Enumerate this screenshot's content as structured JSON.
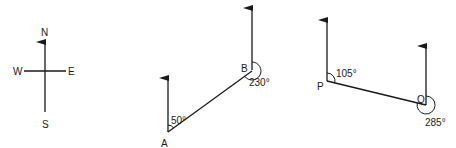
{
  "compass": {
    "north": "N",
    "south": "S",
    "east": "E",
    "west": "W"
  },
  "figure_ab": {
    "point_a": "A",
    "point_b": "B",
    "bearing_a_to_b": "50°",
    "bearing_b_to_a": "230°"
  },
  "figure_pq": {
    "point_p": "P",
    "point_q": "Q",
    "bearing_p_to_q": "105°",
    "bearing_q_to_p": "285°"
  },
  "colors": {
    "ink": "#1a1a1a",
    "background": "#ffffff"
  }
}
